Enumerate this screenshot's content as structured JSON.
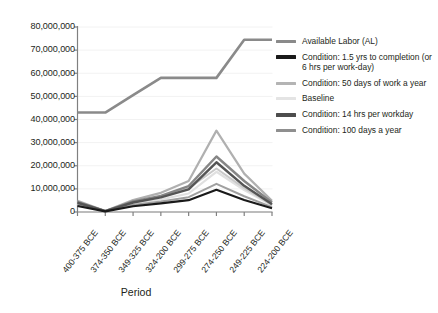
{
  "chart_data": {
    "type": "line",
    "title": "",
    "xlabel": "Period",
    "ylabel": "",
    "categories": [
      "400-375 BCE",
      "374-350 BCE",
      "349-325 BCE",
      "324-200 BCE",
      "299-275 BCE",
      "274-250 BCE",
      "249-225 BCE",
      "224-200 BCE"
    ],
    "ylim": [
      0,
      80000000
    ],
    "yticks": [
      0,
      10000000,
      20000000,
      30000000,
      40000000,
      50000000,
      60000000,
      70000000,
      80000000
    ],
    "ytick_labels": [
      "0",
      "10,000,000",
      "20,000,000",
      "30,000,000",
      "40,000,000",
      "50,000,000",
      "60,000,000",
      "70,000,000",
      "80,000,000"
    ],
    "grid": true,
    "legend_position": "right",
    "series": [
      {
        "name": "Available Labor (AL)",
        "color": "#8a8a8a",
        "width": 2.6,
        "values": [
          43000000,
          43000000,
          50500000,
          58000000,
          58000000,
          58000000,
          74500000,
          74500000
        ]
      },
      {
        "name": "Condition: 1.5 yrs to completion (or 6 hrs per work-day)",
        "color": "#1a1a1a",
        "width": 2.2,
        "values": [
          2600000,
          300000,
          2500000,
          3700000,
          5100000,
          9600000,
          5200000,
          1600000
        ]
      },
      {
        "name": "Condition: 50 days of work a year",
        "color": "#b0b0b0",
        "width": 2.2,
        "values": [
          4900000,
          450000,
          5200000,
          8300000,
          13400000,
          35200000,
          16600000,
          4900000
        ]
      },
      {
        "name": "Baseline",
        "color": "#e0e0e0",
        "width": 2.2,
        "values": [
          3500000,
          380000,
          3600000,
          5400000,
          8000000,
          17400000,
          9500000,
          2900000
        ]
      },
      {
        "name": "Condition: 14 hrs per workday",
        "color": "#555555",
        "width": 2.4,
        "values": [
          4000000,
          400000,
          4100000,
          6300000,
          9800000,
          21500000,
          11300000,
          3400000
        ]
      },
      {
        "name": "Condition: 100 days a year",
        "color": "#868686",
        "width": 2.4,
        "values": [
          4400000,
          420000,
          4600000,
          7000000,
          11200000,
          24000000,
          13400000,
          4100000
        ]
      },
      {
        "name": "Condition: overlay light",
        "color": "#c9c9c9",
        "width": 2.0,
        "values": [
          4100000,
          400000,
          4300000,
          6600000,
          10300000,
          18800000,
          10300000,
          3100000
        ]
      },
      {
        "name": "Condition: overlay mid",
        "color": "#a0a0a0",
        "width": 2.0,
        "values": [
          3100000,
          340000,
          3000000,
          4500000,
          6400000,
          12200000,
          6800000,
          2100000
        ]
      }
    ]
  },
  "legend": {
    "items": [
      {
        "label": "Available Labor (AL)",
        "color": "#8a8a8a",
        "weight": "normal"
      },
      {
        "label": "Condition: 1.5 yrs to completion (or 6 hrs per work-day)",
        "color": "#1a1a1a",
        "weight": "thick"
      },
      {
        "label": "Condition: 50 days of work a year",
        "color": "#b4b4b4",
        "weight": "normal"
      },
      {
        "label": "Baseline",
        "color": "#e4e4e4",
        "weight": "normal"
      },
      {
        "label": "Condition: 14 hrs per workday",
        "color": "#4d4d4d",
        "weight": "thick"
      },
      {
        "label": "Condition: 100 days a year",
        "color": "#8f8f8f",
        "weight": "normal"
      }
    ]
  },
  "axis": {
    "x_title": "Period"
  },
  "colors": {
    "background": "#ffffff",
    "text": "#231f20",
    "axis": "#808080",
    "grid": "#f2f2f2"
  }
}
